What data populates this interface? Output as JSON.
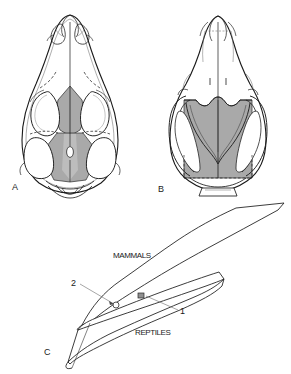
{
  "figure": {
    "panels": [
      {
        "id": "A",
        "letter": "A",
        "subject": "reptile-skull-dorsal-view",
        "shaded_region": "parietal-frontal-bones",
        "features": [
          "pineal-foramen",
          "orbit",
          "temporal-fenestra",
          "nasal-opening"
        ]
      },
      {
        "id": "B",
        "letter": "B",
        "subject": "mammal-skull-dorsal-view",
        "shaded_region": "parietal-bone",
        "features": [
          "sagittal-crest",
          "zygomatic-arch",
          "orbit",
          "nasal-bones"
        ]
      },
      {
        "id": "C",
        "letter": "C",
        "subject": "evolutionary-relationship-diagram"
      }
    ]
  },
  "diagram": {
    "taxa": [
      {
        "name": "mammals",
        "label": "MAMMALS"
      },
      {
        "name": "reptiles",
        "label": "REPTILES"
      }
    ],
    "markers": [
      {
        "id": "1",
        "label": "1",
        "name": "marker-one"
      },
      {
        "id": "2",
        "label": "2",
        "name": "marker-two"
      }
    ]
  },
  "colors": {
    "shading": "#a9a9a9",
    "shading_light": "#c8c8c8",
    "outline": "#1a1a1a",
    "thin_line": "#4a4a4a",
    "background": "#ffffff"
  }
}
